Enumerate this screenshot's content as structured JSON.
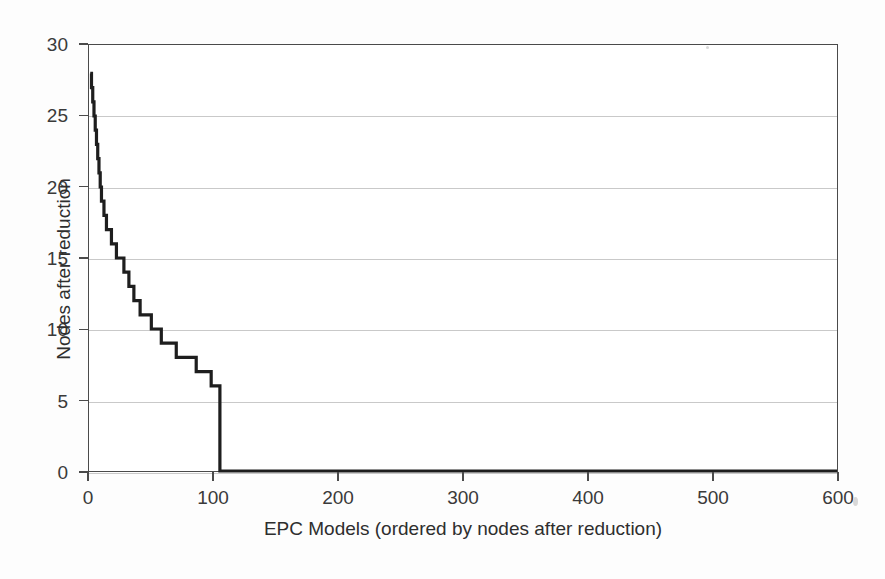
{
  "chart_data": {
    "type": "line",
    "title": "",
    "subtitle": "",
    "xlabel": "EPC Models (ordered by nodes after reduction)",
    "ylabel": "Nodes after reduction",
    "xlim": [
      0,
      600
    ],
    "ylim": [
      0,
      30
    ],
    "xticks": [
      0,
      100,
      200,
      300,
      400,
      500,
      600
    ],
    "yticks": [
      0,
      5,
      10,
      15,
      20,
      25,
      30
    ],
    "xtick_labels": [
      "0",
      "100",
      "200",
      "300",
      "400",
      "500",
      "600"
    ],
    "ytick_labels": [
      "0",
      "5",
      "10",
      "15",
      "20",
      "25",
      "30"
    ],
    "grid": "horizontal",
    "legend": "none",
    "line_color": "#1e1e1e",
    "line_width": 3.2,
    "grid_color": "#c9c9c9",
    "axis_color": "#4a4a4a",
    "background_color": "#ffffff",
    "series": [
      {
        "name": "Nodes after reduction",
        "step": "post",
        "x": [
          1,
          2,
          3,
          4,
          5,
          6,
          7,
          8,
          9,
          10,
          12,
          14,
          16,
          18,
          20,
          22,
          24,
          26,
          28,
          30,
          32,
          34,
          36,
          38,
          41,
          44,
          47,
          50,
          54,
          58,
          62,
          66,
          70,
          75,
          80,
          86,
          92,
          98,
          104,
          105,
          600
        ],
        "y": [
          28,
          27,
          26,
          25,
          24,
          23,
          22,
          21,
          20,
          19,
          18,
          17,
          17,
          16,
          16,
          15,
          15,
          15,
          14,
          14,
          13,
          13,
          12,
          12,
          11,
          11,
          11,
          10,
          10,
          9,
          9,
          9,
          8,
          8,
          8,
          7,
          7,
          6,
          6,
          0,
          0
        ]
      }
    ],
    "annotations": [
      "Curve starts at 28 nodes and decays monotonically as a step function",
      "Drops to 0 just past x = 104, flat at 0 through x = 600"
    ]
  }
}
